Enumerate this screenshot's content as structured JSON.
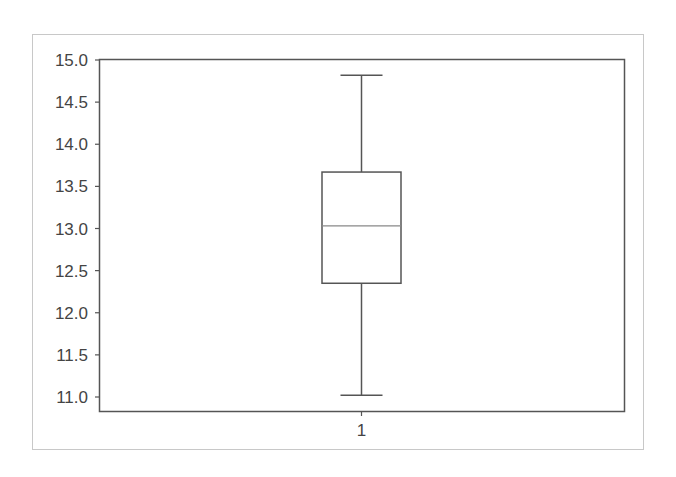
{
  "chart_data": {
    "type": "boxplot",
    "title": "",
    "xlabel": "",
    "ylabel": "",
    "categories": [
      "1"
    ],
    "series": [
      {
        "name": "1",
        "whisker_low": 11.02,
        "q1": 12.35,
        "median": 13.03,
        "q3": 13.67,
        "whisker_high": 14.82
      }
    ],
    "ylim": [
      10.83,
      15.0
    ],
    "yticks": [
      "11.0",
      "11.5",
      "12.0",
      "12.5",
      "13.0",
      "13.5",
      "14.0",
      "14.5",
      "15.0"
    ],
    "xticks": [
      "1"
    ],
    "grid": false,
    "legend": null
  },
  "colors": {
    "axes": "#555555",
    "box": "#555555",
    "frame": "#c8c8c8",
    "text": "#444444"
  }
}
